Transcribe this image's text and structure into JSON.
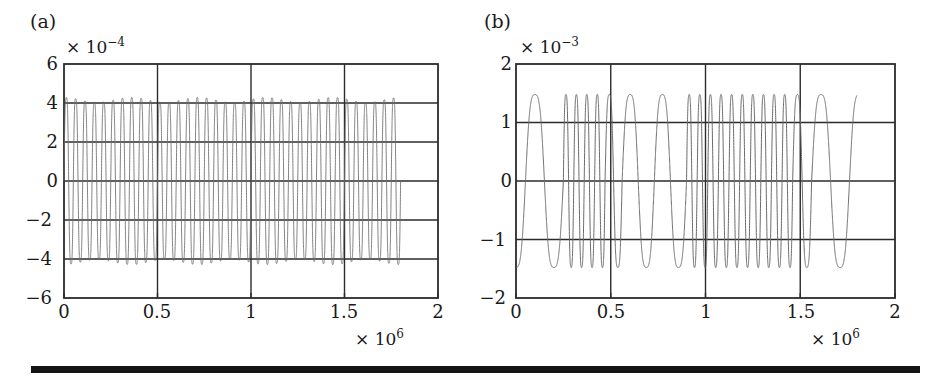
{
  "figure": {
    "background": "#ffffff",
    "trace_color": "#6b6b6b",
    "axis_color": "#2b2b2b",
    "rule_color": "#141414"
  },
  "panels": [
    {
      "id": "a",
      "label": "(a)",
      "y_multiplier_prefix": "× 10",
      "y_multiplier_exponent": "−4",
      "x_multiplier_prefix": "× 10",
      "x_multiplier_exponent": "6",
      "yticks": [
        "6",
        "4",
        "2",
        "0",
        "−2",
        "−4",
        "−6"
      ],
      "xticks": [
        "0",
        "0.5",
        "1",
        "1.5",
        "2"
      ]
    },
    {
      "id": "b",
      "label": "(b)",
      "y_multiplier_prefix": "× 10",
      "y_multiplier_exponent": "−3",
      "x_multiplier_prefix": "× 10",
      "x_multiplier_exponent": "6",
      "yticks": [
        "2",
        "1",
        "0",
        "−1",
        "−2"
      ],
      "xticks": [
        "0",
        "0.5",
        "1",
        "1.5",
        "2"
      ]
    }
  ],
  "chart_data": [
    {
      "type": "line",
      "panel": "a",
      "title": "(a)",
      "xlabel": "",
      "ylabel": "",
      "xlim": [
        0,
        2000000
      ],
      "ylim": [
        -0.0006,
        0.0006
      ],
      "x_tick_values": [
        0,
        500000,
        1000000,
        1500000,
        2000000
      ],
      "x_tick_labels": [
        "0",
        "0.5",
        "1",
        "1.5",
        "2"
      ],
      "y_tick_values": [
        -0.0006,
        -0.0004,
        -0.0002,
        0,
        0.0002,
        0.0004,
        0.0006
      ],
      "y_tick_labels": [
        "−6",
        "−4",
        "−2",
        "0",
        "2",
        "4",
        "6"
      ],
      "x_scale_factor": 1000000,
      "y_scale_factor": 0.0001,
      "grid": true,
      "legend": null,
      "data_end_x": 1800000,
      "description": "Densely packed high-frequency oscillation filling the axes; envelope roughly constant at ±5×10⁻⁴ with slight amplitude ripple. Roughly 36 visible oscillation packets between 0 and 1.8×10⁶.",
      "series": [
        {
          "name": "signal",
          "color": "#6b6b6b",
          "amplitude": 0.00051,
          "amplitude_modulation_depth": 0.06,
          "carrier_cycles_over_span": 36,
          "envelope_cycles_over_span": 5
        }
      ]
    },
    {
      "type": "line",
      "panel": "b",
      "title": "(b)",
      "xlabel": "",
      "ylabel": "",
      "xlim": [
        0,
        2000000
      ],
      "ylim": [
        -0.002,
        0.002
      ],
      "x_tick_values": [
        0,
        500000,
        1000000,
        1500000,
        2000000
      ],
      "x_tick_labels": [
        "0",
        "0.5",
        "1",
        "1.5",
        "2"
      ],
      "y_tick_values": [
        -0.002,
        -0.001,
        0,
        0.001,
        0.002
      ],
      "y_tick_labels": [
        "−2",
        "−1",
        "0",
        "1",
        "2"
      ],
      "x_scale_factor": 1000000,
      "y_scale_factor": 0.001,
      "grid": true,
      "legend": null,
      "data_end_x": 1800000,
      "description": "Alternating slow and fast oscillation bursts. Peak amplitude about ±1.7×10⁻³ with flattened/notched crests. Wide slow lobes near t≈0.15, 0.65, 0.8, 1.6 and 1.75 ×10⁶ separated by groups of rapid cycles.",
      "series": [
        {
          "name": "signal",
          "color": "#6b6b6b",
          "amplitude": 0.00172,
          "segments": [
            {
              "x_start": 0,
              "x_end": 250000,
              "cycles": 1.25,
              "rate": "slow"
            },
            {
              "x_start": 250000,
              "x_end": 470000,
              "cycles": 4,
              "rate": "fast"
            },
            {
              "x_start": 470000,
              "x_end": 560000,
              "cycles": 1,
              "rate": "medium"
            },
            {
              "x_start": 560000,
              "x_end": 900000,
              "cycles": 2,
              "rate": "slow"
            },
            {
              "x_start": 900000,
              "x_end": 1460000,
              "cycles": 10,
              "rate": "fast"
            },
            {
              "x_start": 1460000,
              "x_end": 1560000,
              "cycles": 1,
              "rate": "medium"
            },
            {
              "x_start": 1560000,
              "x_end": 1800000,
              "cycles": 1.2,
              "rate": "slow"
            }
          ]
        }
      ]
    }
  ]
}
